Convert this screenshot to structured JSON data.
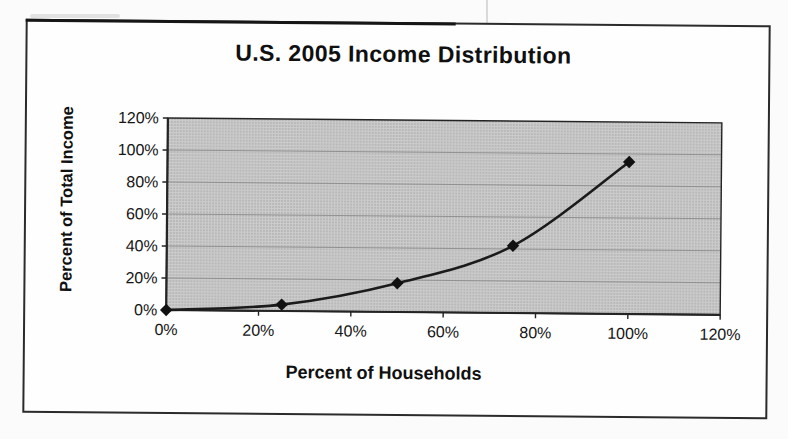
{
  "page": {
    "background_color": "#fbfbfb",
    "frame_border_color": "#2b2b2b"
  },
  "chart_data": {
    "type": "line",
    "title": "U.S. 2005 Income Distribution",
    "xlabel": "Percent of Households",
    "ylabel": "Percent of Total Income",
    "x": [
      0,
      25,
      50,
      75,
      100
    ],
    "series": [
      {
        "name": "Lorenz curve of cumulative income share",
        "values": [
          0,
          4,
          18,
          42,
          95
        ]
      }
    ],
    "x_tick_labels": [
      "0%",
      "20%",
      "40%",
      "60%",
      "80%",
      "100%",
      "120%"
    ],
    "y_tick_labels": [
      "0%",
      "20%",
      "40%",
      "60%",
      "80%",
      "100%",
      "120%"
    ],
    "xlim": [
      0,
      120
    ],
    "ylim": [
      0,
      120
    ],
    "grid": "horizontal",
    "legend": "none",
    "marker": "diamond",
    "line_color": "#1b1b1b",
    "marker_color": "#111111",
    "plot_bg_color": "#cccccc",
    "plot_bg_dot_color": "#9b9b9b",
    "gridline_color": "#8d8d8d",
    "axis_color": "#242424",
    "text_color": "#151515"
  }
}
